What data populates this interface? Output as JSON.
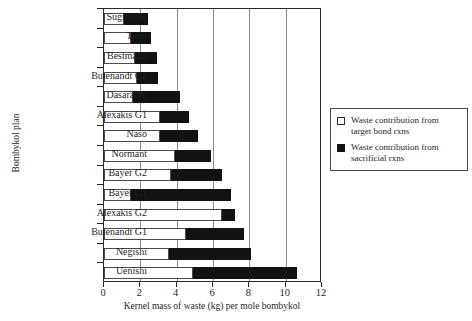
{
  "chart_data": {
    "type": "bar",
    "orientation": "horizontal",
    "stacked": true,
    "title": "",
    "xlabel": "Kernel mass of waste (kg) per mole bombykol",
    "ylabel": "Bombykol plan",
    "xlim": [
      0,
      12
    ],
    "xticks": [
      0,
      2,
      4,
      6,
      8,
      10,
      12
    ],
    "grid": "vertical",
    "legend_position": "right-outside",
    "categories": [
      "Suginome",
      "Trost",
      "Bestmann",
      "Butenandt G2",
      "Dasaradhi",
      "Alexakis G1",
      "Naso",
      "Normant",
      "Bayer G2",
      "Bayer G1",
      "Alexakis G2",
      "Butenandt G1",
      "Negishi",
      "Uenishi"
    ],
    "series": [
      {
        "name": "Waste contribution from target bond rxns",
        "color": "#ffffff",
        "values": [
          1.1,
          1.5,
          1.7,
          1.8,
          1.6,
          3.1,
          3.1,
          3.9,
          3.7,
          1.5,
          6.5,
          4.5,
          3.6,
          4.9
        ]
      },
      {
        "name": "Waste contribution from sacrificial rxns",
        "color": "#121212",
        "values": [
          1.3,
          1.1,
          1.2,
          1.2,
          2.6,
          1.6,
          2.1,
          2.0,
          2.8,
          5.5,
          0.7,
          3.2,
          4.5,
          5.7
        ]
      }
    ],
    "totals": [
      2.4,
      2.6,
      2.9,
      3.0,
      4.2,
      4.7,
      5.2,
      5.9,
      6.5,
      7.0,
      7.2,
      7.7,
      8.1,
      10.6
    ]
  },
  "legend": {
    "items": [
      {
        "swatch": "open-square",
        "line1": "Waste contribution from",
        "line2": "target bond rxns"
      },
      {
        "swatch": "filled-square",
        "line1": "Waste contribution from",
        "line2": "sacrificial rxns"
      }
    ]
  }
}
